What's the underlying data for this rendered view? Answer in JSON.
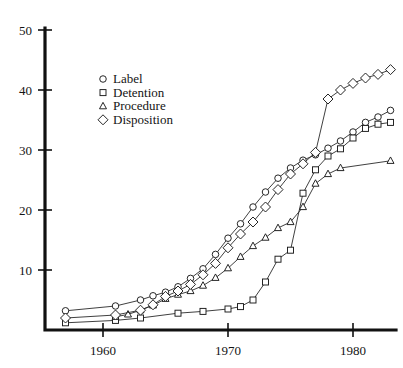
{
  "chart_data": {
    "type": "line",
    "title": "",
    "subtitle": "",
    "xlabel": "",
    "ylabel": "",
    "xlim": [
      1956,
      1984.5
    ],
    "ylim": [
      0,
      50
    ],
    "grid": false,
    "legend_position": "upper-left-inner",
    "x_ticks": [
      1960,
      1970,
      1980
    ],
    "x_tick_labels": [
      "1960",
      "1970",
      "1980"
    ],
    "y_ticks": [
      10,
      20,
      30,
      40,
      50
    ],
    "y_tick_labels": [
      "10",
      "20",
      "30",
      "40",
      "50"
    ],
    "series": [
      {
        "name": "Label",
        "marker": "circle",
        "points": [
          [
            1957,
            3.2
          ],
          [
            1961,
            4.0
          ],
          [
            1963,
            5.0
          ],
          [
            1964,
            5.7
          ],
          [
            1965,
            6.3
          ],
          [
            1966,
            7.2
          ],
          [
            1967,
            8.6
          ],
          [
            1968,
            10.2
          ],
          [
            1969,
            12.6
          ],
          [
            1970,
            15.3
          ],
          [
            1971,
            17.7
          ],
          [
            1972,
            20.5
          ],
          [
            1973,
            23.0
          ],
          [
            1974,
            25.3
          ],
          [
            1975,
            27.0
          ],
          [
            1976,
            28.3
          ],
          [
            1977,
            29.2
          ],
          [
            1978,
            30.3
          ],
          [
            1979,
            31.5
          ],
          [
            1980,
            33.0
          ],
          [
            1981,
            34.6
          ],
          [
            1982,
            35.5
          ],
          [
            1983,
            36.6
          ]
        ]
      },
      {
        "name": "Detention",
        "marker": "square",
        "points": [
          [
            1957,
            1.2
          ],
          [
            1961,
            1.6
          ],
          [
            1963,
            2.0
          ],
          [
            1966,
            2.8
          ],
          [
            1968,
            3.1
          ],
          [
            1970,
            3.5
          ],
          [
            1971,
            3.9
          ],
          [
            1972,
            5.0
          ],
          [
            1973,
            8.0
          ],
          [
            1974,
            11.8
          ],
          [
            1975,
            13.3
          ],
          [
            1976,
            22.8
          ],
          [
            1977,
            26.7
          ],
          [
            1978,
            29.0
          ],
          [
            1979,
            30.2
          ],
          [
            1980,
            32.0
          ],
          [
            1981,
            33.6
          ],
          [
            1982,
            34.3
          ],
          [
            1983,
            34.6
          ]
        ]
      },
      {
        "name": "Procedure",
        "marker": "triangle",
        "points": [
          [
            1961,
            2.2
          ],
          [
            1962,
            2.6
          ],
          [
            1963,
            3.3
          ],
          [
            1964,
            4.1
          ],
          [
            1965,
            5.2
          ],
          [
            1966,
            5.9
          ],
          [
            1967,
            6.5
          ],
          [
            1968,
            7.4
          ],
          [
            1969,
            8.7
          ],
          [
            1970,
            10.3
          ],
          [
            1971,
            12.2
          ],
          [
            1972,
            14.0
          ],
          [
            1973,
            15.4
          ],
          [
            1974,
            17.0
          ],
          [
            1975,
            18.0
          ],
          [
            1976,
            20.5
          ],
          [
            1977,
            24.4
          ],
          [
            1978,
            26.0
          ],
          [
            1979,
            27.0
          ],
          [
            1983,
            28.2
          ]
        ]
      },
      {
        "name": "Disposition",
        "marker": "diamond",
        "points": [
          [
            1957,
            2.0
          ],
          [
            1961,
            2.5
          ],
          [
            1963,
            3.3
          ],
          [
            1964,
            4.2
          ],
          [
            1965,
            5.6
          ],
          [
            1966,
            6.5
          ],
          [
            1967,
            7.6
          ],
          [
            1968,
            9.2
          ],
          [
            1969,
            11.1
          ],
          [
            1970,
            13.7
          ],
          [
            1971,
            16.0
          ],
          [
            1972,
            18.0
          ],
          [
            1973,
            20.5
          ],
          [
            1974,
            23.4
          ],
          [
            1975,
            26.0
          ],
          [
            1976,
            27.7
          ],
          [
            1977,
            29.6
          ],
          [
            1978,
            38.5
          ],
          [
            1979,
            40.0
          ],
          [
            1980,
            41.1
          ],
          [
            1981,
            42.0
          ],
          [
            1982,
            42.6
          ],
          [
            1983,
            43.4
          ]
        ]
      }
    ]
  },
  "legend": {
    "entries": [
      {
        "label": "Label",
        "marker": "circle"
      },
      {
        "label": "Detention",
        "marker": "square"
      },
      {
        "label": "Procedure",
        "marker": "triangle"
      },
      {
        "label": "Disposition",
        "marker": "diamond"
      }
    ]
  }
}
